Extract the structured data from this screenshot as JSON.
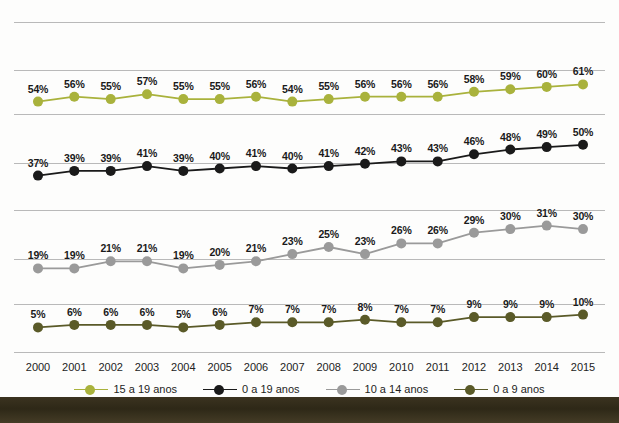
{
  "chart_data": {
    "type": "line",
    "title": "",
    "subtitle": "",
    "xlabel": "",
    "ylabel": "",
    "grid": true,
    "legend_position": "bottom",
    "value_suffix": "%",
    "categories": [
      "2000",
      "2001",
      "2002",
      "2003",
      "2004",
      "2005",
      "2006",
      "2007",
      "2008",
      "2009",
      "2010",
      "2011",
      "2012",
      "2013",
      "2014",
      "2015"
    ],
    "series": [
      {
        "name": "0 a 19 anos",
        "color": "#1a1a1a",
        "band": 1,
        "band_top_pct": 36,
        "band_bottom_pct": 52,
        "values": [
          37,
          39,
          39,
          41,
          39,
          40,
          41,
          40,
          41,
          42,
          43,
          43,
          46,
          48,
          49,
          50
        ],
        "labels": [
          "37%",
          "39%",
          "39%",
          "41%",
          "39%",
          "40%",
          "41%",
          "40%",
          "41%",
          "42%",
          "43%",
          "43%",
          "46%",
          "48%",
          "49%",
          "50%"
        ]
      },
      {
        "name": "15 a 19 anos",
        "color": "#a9b23c",
        "band": 0,
        "band_top_pct": 53,
        "band_bottom_pct": 62,
        "values": [
          54,
          56,
          55,
          57,
          55,
          55,
          56,
          54,
          55,
          56,
          56,
          56,
          58,
          59,
          60,
          61
        ],
        "labels": [
          "54%",
          "56%",
          "55%",
          "57%",
          "55%",
          "55%",
          "56%",
          "54%",
          "55%",
          "56%",
          "56%",
          "56%",
          "58%",
          "59%",
          "60%",
          "61%"
        ]
      },
      {
        "name": "10 a 14 anos",
        "color": "#9a9a9a",
        "band": 2,
        "band_top_pct": 18,
        "band_bottom_pct": 32,
        "values": [
          19,
          19,
          21,
          21,
          19,
          20,
          21,
          23,
          25,
          23,
          26,
          26,
          29,
          30,
          31,
          30
        ],
        "labels": [
          "19%",
          "19%",
          "21%",
          "21%",
          "19%",
          "20%",
          "21%",
          "23%",
          "25%",
          "23%",
          "26%",
          "26%",
          "29%",
          "30%",
          "31%",
          "30%"
        ]
      },
      {
        "name": "0 a 9 anos",
        "color": "#5a5a28",
        "band": 3,
        "band_top_pct": 4,
        "band_bottom_pct": 11,
        "values": [
          5,
          6,
          6,
          6,
          5,
          6,
          7,
          7,
          7,
          8,
          7,
          7,
          9,
          9,
          9,
          10
        ],
        "labels": [
          "5%",
          "6%",
          "6%",
          "6%",
          "5%",
          "6%",
          "7%",
          "7%",
          "7%",
          "8%",
          "7%",
          "7%",
          "9%",
          "9%",
          "9%",
          "10%"
        ]
      }
    ],
    "gridlines_y": [
      22,
      70,
      114,
      163,
      210,
      259,
      304,
      352
    ],
    "axis_line_color": "#b9b9b9"
  }
}
